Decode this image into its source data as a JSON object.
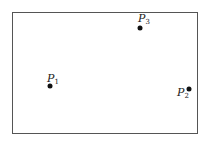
{
  "diagram": {
    "frame": {
      "left": 12,
      "top": 12,
      "right": 198,
      "bottom": 134
    },
    "points": [
      {
        "name": "P",
        "sub": "1",
        "x": 50,
        "y": 86,
        "label_x": 47,
        "label_y": 73
      },
      {
        "name": "P",
        "sub": "2",
        "x": 189,
        "y": 89,
        "label_x": 177,
        "label_y": 87
      },
      {
        "name": "P",
        "sub": "3",
        "x": 140,
        "y": 28,
        "label_x": 138,
        "label_y": 13
      }
    ]
  }
}
